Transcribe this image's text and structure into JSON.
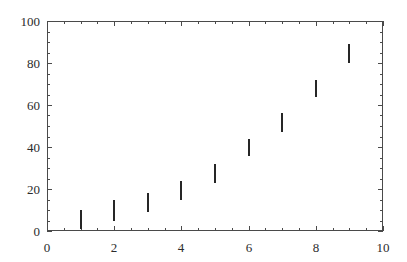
{
  "figure": {
    "background_color": "#ffffff",
    "frame_color": "#4a4a4a",
    "mark_color": "#262626"
  },
  "chart_data": {
    "type": "scatter",
    "title": "",
    "subtitle": "",
    "xlabel": "",
    "ylabel": "",
    "xlim": [
      0,
      10
    ],
    "ylim": [
      0,
      100
    ],
    "grid": false,
    "legend": null,
    "annotations": [],
    "x_ticks_major": [
      0,
      2,
      4,
      6,
      8,
      10
    ],
    "x_tick_labels": [
      "0",
      "2",
      "4",
      "6",
      "8",
      "10"
    ],
    "x_minor_step": 0.5,
    "y_ticks_major": [
      0,
      20,
      40,
      60,
      80,
      100
    ],
    "y_tick_labels": [
      "0",
      "20",
      "40",
      "60",
      "80",
      "100"
    ],
    "y_minor_step": 5,
    "marker_style": "vertical-bar",
    "x": [
      1,
      2,
      3,
      4,
      5,
      6,
      7,
      8,
      9
    ],
    "values": [
      6,
      10,
      14,
      20,
      27,
      40,
      52,
      68,
      85
    ],
    "series": [
      {
        "name": "data",
        "points": [
          {
            "x": 1,
            "y": 6,
            "y_low": 1,
            "y_high": 10
          },
          {
            "x": 2,
            "y": 10,
            "y_low": 5,
            "y_high": 15
          },
          {
            "x": 3,
            "y": 14,
            "y_low": 9,
            "y_high": 18
          },
          {
            "x": 4,
            "y": 20,
            "y_low": 15,
            "y_high": 24
          },
          {
            "x": 5,
            "y": 27,
            "y_low": 23,
            "y_high": 32
          },
          {
            "x": 6,
            "y": 40,
            "y_low": 36,
            "y_high": 44
          },
          {
            "x": 7,
            "y": 52,
            "y_low": 47,
            "y_high": 56
          },
          {
            "x": 8,
            "y": 68,
            "y_low": 64,
            "y_high": 72
          },
          {
            "x": 9,
            "y": 85,
            "y_low": 80,
            "y_high": 89
          }
        ]
      }
    ]
  }
}
